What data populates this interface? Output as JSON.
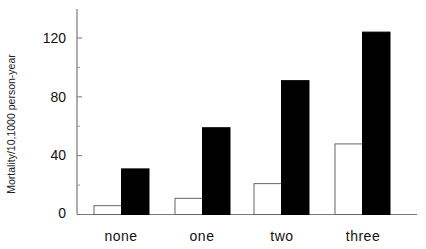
{
  "chart_data": {
    "type": "bar",
    "title": "",
    "xlabel": "",
    "ylabel": "Mortality/10,1000 person-year",
    "categories": [
      "none",
      "one",
      "two",
      "three"
    ],
    "series": [
      {
        "name": "white bars",
        "color": "#ffffff",
        "values": [
          6,
          11,
          21,
          48
        ]
      },
      {
        "name": "black bars",
        "color": "#000000",
        "values": [
          31,
          59,
          91,
          124
        ]
      }
    ],
    "yticks": [
      0,
      40,
      80,
      120
    ],
    "yminor_ticks": [
      20,
      60,
      100
    ],
    "ylim": [
      0,
      140
    ],
    "grid": false,
    "legend": null
  },
  "axis": {
    "ylabel": "Mortality/10,1000 person-year",
    "ytick_labels": [
      "0",
      "40",
      "80",
      "120"
    ],
    "xtick_labels": [
      "none",
      "one",
      "two",
      "three"
    ]
  }
}
